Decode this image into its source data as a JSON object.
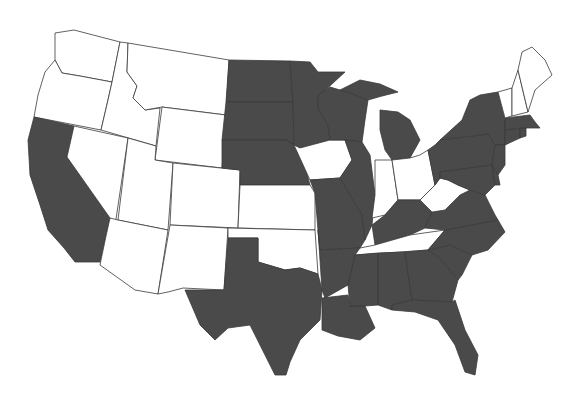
{
  "map": {
    "title": "",
    "colors": {
      "shaded": "#4a4a4a",
      "unshaded": "#ffffff",
      "border": "#3a3a3a"
    },
    "legend": [],
    "states": [
      {
        "code": "WA",
        "shaded": false,
        "points": "55,33 74,30 120,42 112,82 80,76 62,73 55,60"
      },
      {
        "code": "OR",
        "shaded": false,
        "points": "55,60 62,73 80,76 112,82 108,100 101,130 34,117 38,95 45,72"
      },
      {
        "code": "CA",
        "shaded": true,
        "points": "34,117 74,126 67,157 110,218 106,236 100,262 75,262 64,248 48,230 40,205 30,175 28,140"
      },
      {
        "code": "ID",
        "shaded": false,
        "points": "120,42 128,43 127,72 137,86 133,98 145,110 160,108 156,146 101,130 108,100 112,82"
      },
      {
        "code": "NV",
        "shaded": false,
        "points": "74,126 128,138 115,226 110,218 67,157"
      },
      {
        "code": "MT",
        "shaded": false,
        "points": "128,43 229,60 226,115 162,107 145,110 133,98 137,86 127,72"
      },
      {
        "code": "WY",
        "shaded": false,
        "points": "162,107 226,115 222,168 155,160"
      },
      {
        "code": "UT",
        "shaded": false,
        "points": "128,138 156,146 155,160 173,163 168,230 118,220"
      },
      {
        "code": "AZ",
        "shaded": false,
        "points": "118,220 168,230 158,294 135,290 100,265 106,236 110,218"
      },
      {
        "code": "CO",
        "shaded": false,
        "points": "173,163 240,170 238,228 170,225"
      },
      {
        "code": "NM",
        "shaded": false,
        "points": "170,225 228,228 224,290 183,288 168,292 158,294"
      },
      {
        "code": "ND",
        "shaded": true,
        "points": "229,60 290,61 293,102 226,102"
      },
      {
        "code": "SD",
        "shaded": true,
        "points": "226,102 293,102 294,145 286,140 222,140"
      },
      {
        "code": "NE",
        "shaded": true,
        "points": "222,140 286,140 300,148 310,185 240,185 240,170 222,168"
      },
      {
        "code": "KS",
        "shaded": false,
        "points": "240,185 310,185 315,193 315,230 238,228"
      },
      {
        "code": "OK",
        "shaded": false,
        "points": "228,228 315,230 318,274 300,268 285,270 258,262 258,238 228,238"
      },
      {
        "code": "TX",
        "shaded": true,
        "points": "228,238 258,238 258,262 285,270 300,268 318,274 322,290 320,320 300,340 290,362 286,375 275,375 265,355 250,325 228,328 215,340 200,325 185,290 224,290"
      },
      {
        "code": "MN",
        "shaded": true,
        "points": "290,61 310,62 318,72 345,72 320,95 318,108 328,125 330,140 300,148 294,145 293,102"
      },
      {
        "code": "IA",
        "shaded": false,
        "points": "294,145 300,148 330,140 345,140 352,160 340,178 310,180"
      },
      {
        "code": "MO",
        "shaded": true,
        "points": "310,180 340,178 350,195 362,215 365,240 360,248 320,250 318,230 315,193"
      },
      {
        "code": "AR",
        "shaded": true,
        "points": "318,230 320,250 360,248 355,262 348,285 325,298 322,290"
      },
      {
        "code": "LA",
        "shaded": true,
        "points": "322,298 348,295 350,306 365,306 375,328 360,340 338,336 322,330"
      },
      {
        "code": "WI",
        "shaded": true,
        "points": "318,95 330,87 350,93 368,100 365,120 362,142 345,140 330,140 328,125 318,108"
      },
      {
        "code": "IL",
        "shaded": true,
        "points": "345,140 362,142 370,155 375,195 372,225 365,240 362,215 350,195 340,178 352,160"
      },
      {
        "code": "MI",
        "shaded": true,
        "points": "380,110 398,112 410,120 420,140 410,158 392,160 385,150 380,130"
      },
      {
        "code": "MI-UP",
        "shaded": true,
        "points": "340,90 360,80 380,84 398,92 382,96 368,100 350,93"
      },
      {
        "code": "IN",
        "shaded": false,
        "points": "375,160 392,160 398,200 385,215 372,218 375,195"
      },
      {
        "code": "OH",
        "shaded": false,
        "points": "392,160 410,158 420,155 428,150 435,185 420,200 398,200"
      },
      {
        "code": "KY",
        "shaded": true,
        "points": "372,225 385,215 398,200 420,200 432,212 425,228 410,235 375,245"
      },
      {
        "code": "TN",
        "shaded": false,
        "points": "360,248 375,245 410,235 445,230 428,250 400,252 355,255"
      },
      {
        "code": "MS",
        "shaded": true,
        "points": "355,255 378,253 378,305 365,306 350,306 348,285"
      },
      {
        "code": "AL",
        "shaded": true,
        "points": "378,253 405,252 412,300 392,305 392,310 378,305"
      },
      {
        "code": "GA",
        "shaded": true,
        "points": "405,252 428,250 440,258 458,280 452,302 412,300"
      },
      {
        "code": "FL",
        "shaded": true,
        "points": "392,310 392,305 412,300 452,302 455,300 465,330 478,355 475,375 465,372 455,345 438,320 415,312"
      },
      {
        "code": "SC",
        "shaded": true,
        "points": "428,250 450,245 472,255 462,275 458,280 440,258"
      },
      {
        "code": "NC",
        "shaded": true,
        "points": "445,230 498,220 505,232 488,250 472,255 450,245 428,250"
      },
      {
        "code": "VA",
        "shaded": true,
        "points": "425,228 432,212 445,210 460,195 470,190 485,195 495,215 498,220 445,230"
      },
      {
        "code": "WV",
        "shaded": false,
        "points": "420,200 435,185 440,178 448,180 458,185 470,190 460,195 445,210 432,212"
      },
      {
        "code": "PA",
        "shaded": true,
        "points": "428,150 435,145 440,140 488,134 495,145 492,165 440,172 440,178 435,185"
      },
      {
        "code": "NY",
        "shaded": true,
        "points": "440,140 462,120 470,100 480,95 498,92 505,120 505,145 495,145 488,134"
      },
      {
        "code": "NJ",
        "shaded": true,
        "points": "495,145 505,145 505,165 498,175 492,165"
      },
      {
        "code": "MD",
        "shaded": true,
        "points": "440,178 440,172 492,165 495,185 485,195 470,190 458,185 448,180"
      },
      {
        "code": "DE",
        "shaded": true,
        "points": "492,165 498,175 500,185 495,185"
      },
      {
        "code": "CT",
        "shaded": true,
        "points": "505,130 520,128 520,138 505,145"
      },
      {
        "code": "RI",
        "shaded": true,
        "points": "520,128 526,128 526,136 520,138"
      },
      {
        "code": "MA",
        "shaded": true,
        "points": "505,118 530,115 535,122 540,128 526,128 520,128 505,130"
      },
      {
        "code": "VT",
        "shaded": false,
        "points": "498,92 512,88 512,116 505,118"
      },
      {
        "code": "NH",
        "shaded": false,
        "points": "512,88 518,70 528,112 512,116"
      },
      {
        "code": "ME",
        "shaded": false,
        "points": "518,70 522,52 532,47 545,60 552,75 535,90 528,112"
      }
    ]
  }
}
